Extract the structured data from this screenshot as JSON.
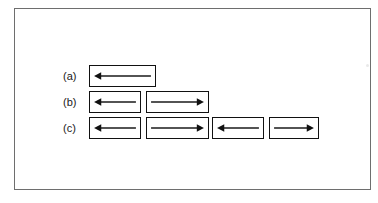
{
  "figure": {
    "background_color": "#ffffff",
    "frame_color": "#6e6e6e",
    "box_border_color": "#111111",
    "arrow_color": "#1a1a1a",
    "rows": [
      {
        "label": "(a)",
        "label_x": 62,
        "top": 64,
        "height": 22,
        "domain_count": 1,
        "boxes": [
          {
            "x": 88,
            "width": 67,
            "direction": "left"
          }
        ]
      },
      {
        "label": "(b)",
        "label_x": 62,
        "top": 90,
        "height": 22,
        "domain_count": 2,
        "boxes": [
          {
            "x": 88,
            "width": 52,
            "direction": "left"
          },
          {
            "x": 145,
            "width": 63,
            "direction": "right"
          }
        ]
      },
      {
        "label": "(c)",
        "label_x": 62,
        "top": 116,
        "height": 22,
        "domain_count": 4,
        "boxes": [
          {
            "x": 88,
            "width": 52,
            "direction": "left"
          },
          {
            "x": 145,
            "width": 63,
            "direction": "right"
          },
          {
            "x": 211,
            "width": 52,
            "direction": "left"
          },
          {
            "x": 268,
            "width": 50,
            "direction": "right"
          }
        ]
      }
    ]
  }
}
